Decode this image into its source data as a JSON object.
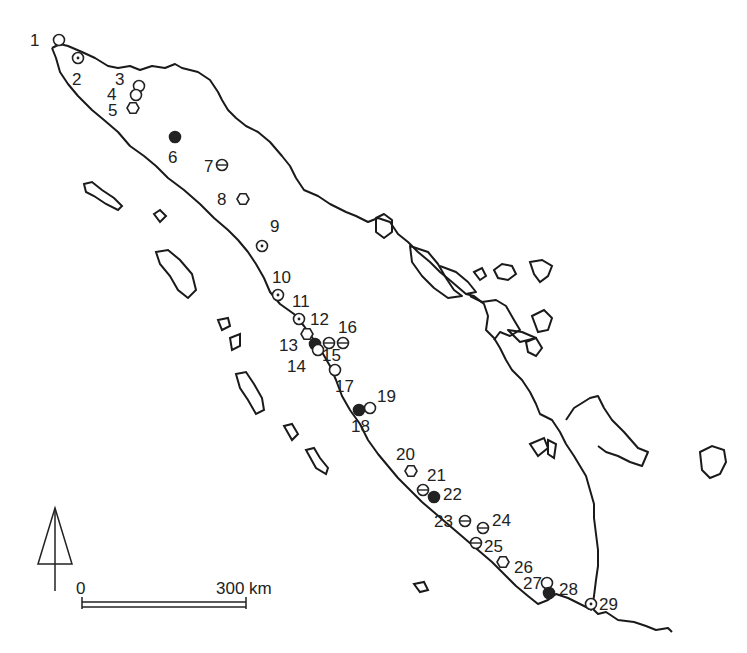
{
  "map": {
    "region": "Sumatra",
    "scale_bar": {
      "start_label": "0",
      "end_label": "300 km"
    },
    "north_arrow": "north-arrow",
    "colors": {
      "ink": "#222222",
      "background": "#ffffff"
    }
  },
  "sites": [
    {
      "id": "1",
      "x": 59,
      "y": 40,
      "marker": "open-circle",
      "lx": 30,
      "ly": 46
    },
    {
      "id": "2",
      "x": 78,
      "y": 58,
      "marker": "dotted-circle",
      "lx": 72,
      "ly": 85
    },
    {
      "id": "3",
      "x": 139,
      "y": 86,
      "marker": "open-circle",
      "lx": 115,
      "ly": 85
    },
    {
      "id": "4",
      "x": 136,
      "y": 95,
      "marker": "open-circle",
      "lx": 107,
      "ly": 100
    },
    {
      "id": "5",
      "x": 133,
      "y": 108,
      "marker": "hexagon",
      "lx": 108,
      "ly": 116
    },
    {
      "id": "6",
      "x": 175,
      "y": 137,
      "marker": "filled-circle",
      "lx": 168,
      "ly": 163
    },
    {
      "id": "7",
      "x": 222,
      "y": 165,
      "marker": "barred-circle",
      "lx": 204,
      "ly": 172
    },
    {
      "id": "8",
      "x": 243,
      "y": 199,
      "marker": "hexagon",
      "lx": 217,
      "ly": 205
    },
    {
      "id": "9",
      "x": 262,
      "y": 246,
      "marker": "dotted-circle",
      "lx": 270,
      "ly": 232
    },
    {
      "id": "10",
      "x": 278,
      "y": 295,
      "marker": "dotted-circle",
      "lx": 272,
      "ly": 283
    },
    {
      "id": "11",
      "x": 299,
      "y": 319,
      "marker": "dotted-circle",
      "lx": 292,
      "ly": 307
    },
    {
      "id": "12",
      "x": 307,
      "y": 334,
      "marker": "hexagon",
      "lx": 310,
      "ly": 325
    },
    {
      "id": "13",
      "x": 315,
      "y": 344,
      "marker": "filled-circle",
      "lx": 279,
      "ly": 351
    },
    {
      "id": "14",
      "x": 318,
      "y": 350,
      "marker": "open-circle",
      "lx": 287,
      "ly": 372
    },
    {
      "id": "15",
      "x": 329,
      "y": 343,
      "marker": "barred-circle",
      "lx": 322,
      "ly": 361
    },
    {
      "id": "16",
      "x": 343,
      "y": 343,
      "marker": "barred-circle",
      "lx": 338,
      "ly": 333
    },
    {
      "id": "17",
      "x": 335,
      "y": 370,
      "marker": "open-circle",
      "lx": 335,
      "ly": 392
    },
    {
      "id": "18",
      "x": 359,
      "y": 410,
      "marker": "filled-circle",
      "lx": 351,
      "ly": 432
    },
    {
      "id": "19",
      "x": 370,
      "y": 408,
      "marker": "open-circle",
      "lx": 377,
      "ly": 402
    },
    {
      "id": "20",
      "x": 411,
      "y": 471,
      "marker": "hexagon",
      "lx": 396,
      "ly": 460
    },
    {
      "id": "21",
      "x": 423,
      "y": 490,
      "marker": "barred-circle",
      "lx": 427,
      "ly": 481
    },
    {
      "id": "22",
      "x": 434,
      "y": 497,
      "marker": "filled-circle",
      "lx": 443,
      "ly": 500
    },
    {
      "id": "23",
      "x": 465,
      "y": 521,
      "marker": "barred-circle",
      "lx": 434,
      "ly": 527
    },
    {
      "id": "24",
      "x": 483,
      "y": 528,
      "marker": "barred-circle",
      "lx": 492,
      "ly": 526
    },
    {
      "id": "25",
      "x": 476,
      "y": 543,
      "marker": "barred-circle",
      "lx": 484,
      "ly": 552
    },
    {
      "id": "26",
      "x": 503,
      "y": 562,
      "marker": "hexagon",
      "lx": 514,
      "ly": 573
    },
    {
      "id": "27",
      "x": 547,
      "y": 583,
      "marker": "open-circle",
      "lx": 523,
      "ly": 589
    },
    {
      "id": "28",
      "x": 549,
      "y": 593,
      "marker": "filled-circle",
      "lx": 559,
      "ly": 595
    },
    {
      "id": "29",
      "x": 591,
      "y": 604,
      "marker": "dotted-circle",
      "lx": 599,
      "ly": 610
    }
  ]
}
